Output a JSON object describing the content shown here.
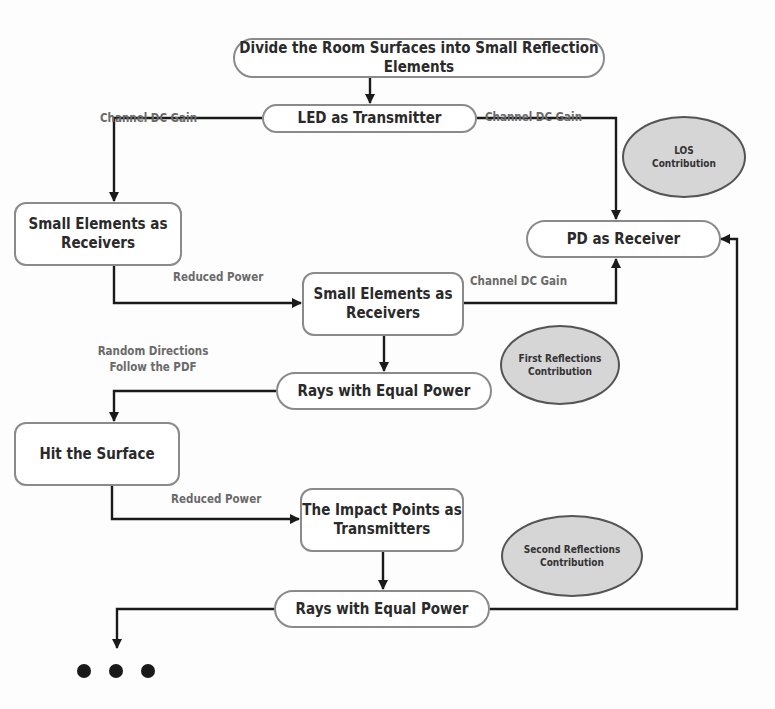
{
  "nodes": {
    "divide": "Divide the Room Surfaces into Small Reflection Elements",
    "led": "LED as Transmitter",
    "small_left": "Small Elements as Receivers",
    "pd": "PD as Receiver",
    "small_mid": "Small Elements as Receivers",
    "rays1": "Rays with Equal Power",
    "hit": "Hit the Surface",
    "impact": "The Impact Points as Transmitters",
    "rays2": "Rays with Equal Power"
  },
  "contributions": {
    "los": "LOS Contribution",
    "first": "First Reflections Contribution",
    "second": "Second Reflections Contribution"
  },
  "edge_labels": {
    "gain_left": "Channel DC Gain",
    "gain_right": "Channel DC Gain",
    "reduced_1": "Reduced Power",
    "gain_mid": "Channel DC Gain",
    "random_line1": "Random Directions",
    "random_line2": "Follow the PDF",
    "reduced_2": "Reduced Power"
  },
  "colors": {
    "node_border": "#8a8a8a",
    "ellipse_fill": "#d6d6d6",
    "arrow": "#1a1a1a",
    "label_text": "#6a6a6a"
  }
}
